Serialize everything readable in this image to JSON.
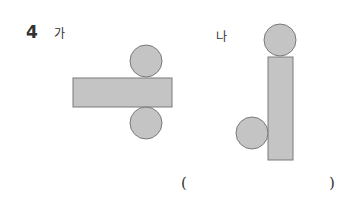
{
  "problem": {
    "number": "4",
    "figures": [
      {
        "label": "가",
        "shapes": {
          "rectangle": {
            "x": 73,
            "y": 78,
            "width": 99,
            "height": 29
          },
          "circles": [
            {
              "cx": 146,
              "cy": 61,
              "r": 16
            },
            {
              "cx": 146,
              "cy": 123,
              "r": 16
            }
          ]
        }
      },
      {
        "label": "나",
        "shapes": {
          "rectangle": {
            "x": 268,
            "y": 57,
            "width": 25,
            "height": 103
          },
          "circles": [
            {
              "cx": 280,
              "cy": 40,
              "r": 16
            },
            {
              "cx": 252,
              "cy": 133,
              "r": 16
            }
          ]
        }
      }
    ],
    "answer_blank": {
      "open": "(",
      "close": ")"
    }
  },
  "colors": {
    "fill": "#c4c4c4",
    "stroke": "#7a7a7a",
    "text": "#333333"
  }
}
